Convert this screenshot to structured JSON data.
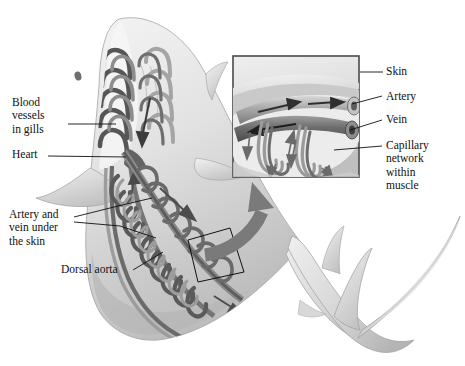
{
  "figure": {
    "background_color": "#ffffff",
    "palette": {
      "body_light": "#e9e9e9",
      "body_mid": "#cfcfcf",
      "body_shadow": "#b0b0b0",
      "vessel_dark": "#5a5a5a",
      "vessel_mid": "#7f7f7f",
      "vessel_light": "#a9a9a9",
      "arrow_gray": "#7a7a7a",
      "leader_line": "#101010",
      "inset_border": "#4a4a4a",
      "inset_fill": "#d8d8d8",
      "text": "#101010"
    }
  },
  "labels": {
    "blood_vessels_in_gills": "Blood\nvessels\nin gills",
    "heart": "Heart",
    "artery_and_vein_under_the_skin": "Artery and\nvein under\nthe skin",
    "dorsal_aorta": "Dorsal aorta",
    "skin": "Skin",
    "artery": "Artery",
    "vein": "Vein",
    "capillary_network_within_muscle": "Capillary\nnetwork\nwithin\nmuscle"
  },
  "inset": {
    "description": "cutaway block of skin and muscle showing artery and vein tubes with capillary networks",
    "flow_arrows": [
      {
        "vessel": "artery",
        "direction": "right"
      },
      {
        "vessel": "vein",
        "direction": "left"
      },
      {
        "vessel": "capillary-descending",
        "direction": "down"
      },
      {
        "vessel": "capillary-ascending",
        "direction": "up"
      }
    ]
  },
  "callout": {
    "description": "quadrilateral region on shark trunk magnified by the inset",
    "arrow": "curved-arrow-to-inset"
  }
}
